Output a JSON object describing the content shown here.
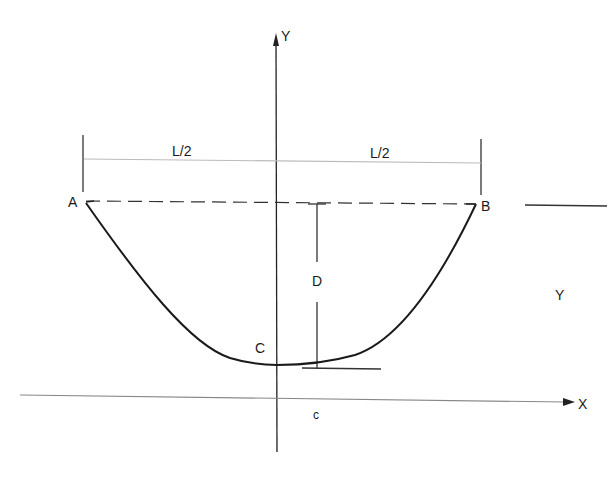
{
  "diagram": {
    "type": "catenary-cable-geometry",
    "axes": {
      "y_axis_label": "Y",
      "x_axis_label": "X"
    },
    "points": {
      "left_support": "A",
      "right_support": "B",
      "lowest_point": "C"
    },
    "dimensions": {
      "left_half_span": "L/2",
      "right_half_span": "L/2",
      "sag_depth": "D",
      "lowest_point_height": "c"
    },
    "side_label": "Y"
  }
}
